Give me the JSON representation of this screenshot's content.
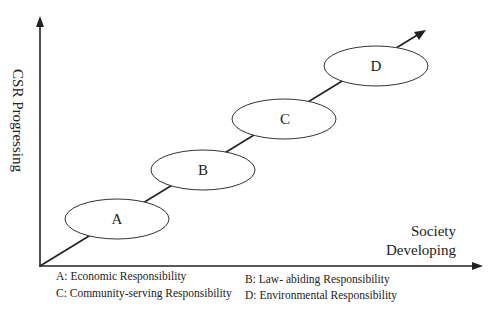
{
  "axes": {
    "y_label": "CSR Progressing",
    "x_label_line1": "Society",
    "x_label_line2": "Developing"
  },
  "stages": [
    {
      "id": "A",
      "label": "A"
    },
    {
      "id": "B",
      "label": "B"
    },
    {
      "id": "C",
      "label": "C"
    },
    {
      "id": "D",
      "label": "D"
    }
  ],
  "legend": [
    {
      "text": "A: Economic Responsibility"
    },
    {
      "text": "B: Law- abiding Responsibility"
    },
    {
      "text": "C: Community-serving Responsibility"
    },
    {
      "text": "D: Environmental Responsibility"
    }
  ],
  "colors": {
    "line": "#222222",
    "background": "#ffffff"
  }
}
